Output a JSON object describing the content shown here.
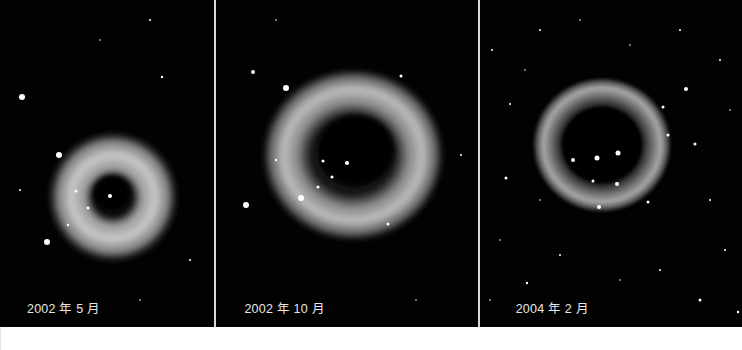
{
  "figure": {
    "panels": [
      {
        "caption": "2002 年 5 月",
        "subject": "light-echo-nebula-early"
      },
      {
        "caption": "2002 年 10 月",
        "subject": "light-echo-nebula-mid"
      },
      {
        "caption": "2004 年 2 月",
        "subject": "light-echo-nebula-late"
      }
    ],
    "colors": {
      "background": "#000000",
      "caption_text": "#e6e6e6",
      "divider": "#d8d8d8"
    }
  }
}
